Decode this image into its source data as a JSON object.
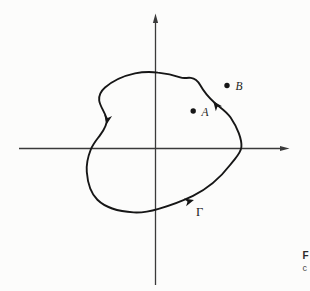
{
  "figure": {
    "curve_label": "Γ",
    "point_a_label": "A",
    "point_b_label": "B",
    "orientation": "counterclockwise"
  },
  "caption_fragment": {
    "line1": "F",
    "line2": "c"
  },
  "colors": {
    "curve": "#161616",
    "axis": "#3a3a3a",
    "label": "#1c1c1c",
    "background": "#fcfcfb"
  }
}
